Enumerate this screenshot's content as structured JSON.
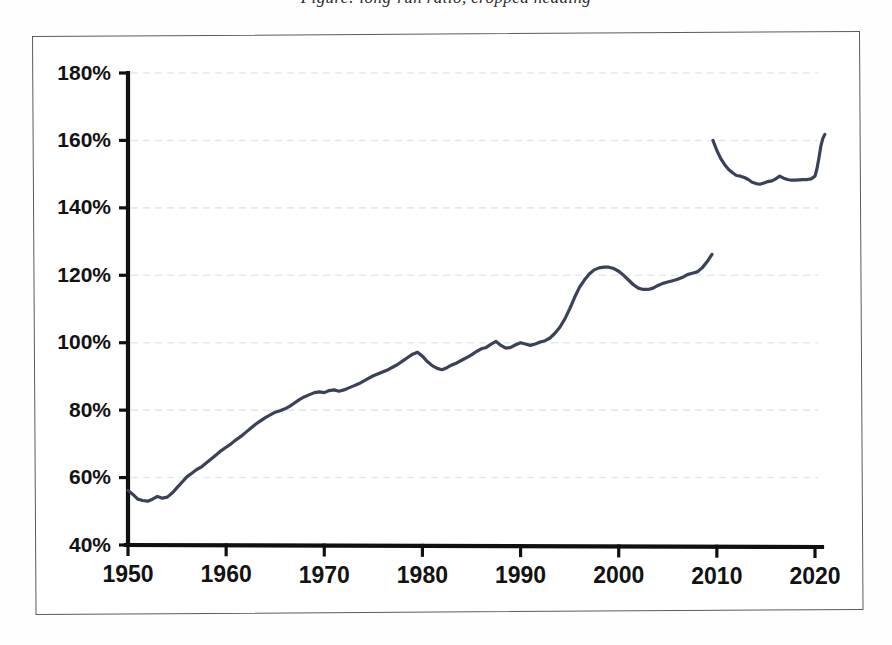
{
  "caption": {
    "clipped_text": "Figure: long-run ratio, cropped heading"
  },
  "figure": {
    "frame_visible": true
  },
  "chart_data": {
    "type": "line",
    "title": "",
    "subtitle": "",
    "xlabel": "",
    "ylabel": "",
    "xlim": [
      1950,
      2021
    ],
    "ylim": [
      40,
      180
    ],
    "grid": true,
    "legend": false,
    "legend_position": "none",
    "y_tick_labels": [
      "40%",
      "60%",
      "80%",
      "100%",
      "120%",
      "140%",
      "160%",
      "180%"
    ],
    "y_tick_values": [
      40,
      60,
      80,
      100,
      120,
      140,
      160,
      180
    ],
    "x_tick_labels": [
      "1950",
      "1960",
      "1970",
      "1980",
      "1990",
      "2000",
      "2010",
      "2020"
    ],
    "x_tick_values": [
      1950,
      1960,
      1970,
      1980,
      1990,
      2000,
      2010,
      2020
    ],
    "series": [
      {
        "name": "ratio",
        "color": "#3a4158",
        "x": [
          1950,
          1950.5,
          1951,
          1951.5,
          1952,
          1952.5,
          1953,
          1953.5,
          1954,
          1954.5,
          1955,
          1955.5,
          1956,
          1956.5,
          1957,
          1957.5,
          1958,
          1958.5,
          1959,
          1959.5,
          1960,
          1960.5,
          1961,
          1961.5,
          1962,
          1962.5,
          1963,
          1963.5,
          1964,
          1964.5,
          1965,
          1965.5,
          1966,
          1966.5,
          1967,
          1967.5,
          1968,
          1968.5,
          1969,
          1969.5,
          1970,
          1970.5,
          1971,
          1971.5,
          1972,
          1972.5,
          1973,
          1973.5,
          1974,
          1974.5,
          1975,
          1975.5,
          1976,
          1976.5,
          1977,
          1977.5,
          1978,
          1978.5,
          1979,
          1979.5,
          1980,
          1980.5,
          1981,
          1981.5,
          1982,
          1982.5,
          1983,
          1983.5,
          1984,
          1984.5,
          1985,
          1985.5,
          1986,
          1986.5,
          1987,
          1987.5,
          1988,
          1988.5,
          1989,
          1989.5,
          1990,
          1990.5,
          1991,
          1991.5,
          1992,
          1992.5,
          1993,
          1993.5,
          1994,
          1994.5,
          1995,
          1995.5,
          1996,
          1996.5,
          1997,
          1997.5,
          1998,
          1998.5,
          1999,
          1999.5,
          2000,
          2000.5,
          2001,
          2001.5,
          2002,
          2002.5,
          2003,
          2003.5,
          2004,
          2004.5,
          2005,
          2005.5,
          2006,
          2006.5,
          2007,
          2007.5,
          2008,
          2008.5,
          2009,
          2009.5,
          2010,
          2010.5,
          2011,
          2011.5,
          2012,
          2012.5,
          2013,
          2013.5,
          2014,
          2014.5,
          2015,
          2015.5,
          2016,
          2016.5,
          2017,
          2017.5,
          2018,
          2018.5,
          2019,
          2019.5,
          2020,
          2020.3,
          2020.6,
          2021
        ],
        "y": [
          56.2,
          55.0,
          53.6,
          53.2,
          53.0,
          53.6,
          54.4,
          53.9,
          54.2,
          55.4,
          57.0,
          58.6,
          60.2,
          61.3,
          62.4,
          63.2,
          64.4,
          65.6,
          66.8,
          68.0,
          69.0,
          70.0,
          71.2,
          72.2,
          73.4,
          74.6,
          75.8,
          76.8,
          77.8,
          78.6,
          79.4,
          79.8,
          80.4,
          81.2,
          82.2,
          83.2,
          84.0,
          84.6,
          85.2,
          85.4,
          85.2,
          85.8,
          86.0,
          85.6,
          86.0,
          86.6,
          87.2,
          87.8,
          88.6,
          89.4,
          90.2,
          90.8,
          91.4,
          92.0,
          92.8,
          93.6,
          94.6,
          95.6,
          96.6,
          97.2,
          96.0,
          94.4,
          93.2,
          92.4,
          92.0,
          92.6,
          93.4,
          94.0,
          94.8,
          95.6,
          96.4,
          97.4,
          98.2,
          98.6,
          99.6,
          100.4,
          99.2,
          98.4,
          98.6,
          99.4,
          100.0,
          99.6,
          99.2,
          99.6,
          100.2,
          100.6,
          101.4,
          102.8,
          104.6,
          107.0,
          110.0,
          113.4,
          116.4,
          118.6,
          120.4,
          121.6,
          122.2,
          122.4,
          122.4,
          122.0,
          121.2,
          120.0,
          118.6,
          117.2,
          116.2,
          115.8,
          115.8,
          116.2,
          117.0,
          117.6,
          118.0,
          118.4,
          118.8,
          119.4,
          120.2,
          120.6,
          121.0,
          122.2,
          124.0,
          126.2,
          128.4,
          130.4,
          132.4,
          133.8,
          134.8,
          136.6,
          139.2,
          142.0,
          145.0,
          148.0,
          151.2,
          154.6,
          158.0,
          161.2,
          163.8,
          165.8,
          166.8,
          166.4,
          167.2,
          165.8,
          166.6,
          165.0,
          162.0,
          160.0
        ]
      }
    ],
    "series_tail": {
      "name": "ratio-tail",
      "x": [
        2009.6,
        2010,
        2010.4,
        2010.8,
        2011.2,
        2011.6,
        2012,
        2012.4,
        2012.8,
        2013.2,
        2013.6,
        2014,
        2014.4,
        2014.8,
        2015.2,
        2015.6,
        2016,
        2016.4,
        2016.8,
        2017.2,
        2017.6,
        2018,
        2018.4,
        2018.8,
        2019.2,
        2019.6,
        2020,
        2020.2,
        2020.4,
        2020.6,
        2020.8,
        2021
      ],
      "y": [
        160.0,
        157.0,
        154.6,
        152.8,
        151.4,
        150.4,
        149.6,
        149.4,
        149.0,
        148.4,
        147.6,
        147.2,
        147.0,
        147.4,
        147.8,
        148.0,
        148.6,
        149.4,
        148.8,
        148.4,
        148.2,
        148.2,
        148.3,
        148.4,
        148.4,
        148.6,
        149.4,
        151.6,
        154.8,
        158.4,
        160.6,
        161.8
      ]
    },
    "annotations": [
      {
        "label": "start",
        "x": 1950,
        "y": 56.2
      },
      {
        "label": "early-trough",
        "x": 1952,
        "y": 53.0
      },
      {
        "label": "1974-peak",
        "x": 1979.5,
        "y": 97.2
      },
      {
        "label": "1990-plateau",
        "x": 1990,
        "y": 122.4
      },
      {
        "label": "1993-trough",
        "x": 2002.5,
        "y": 115.8
      },
      {
        "label": "2008-peak",
        "x": 2019.2,
        "y": 167.2
      },
      {
        "label": "2010s-trough",
        "x": 2014,
        "y": 147.0
      },
      {
        "label": "end",
        "x": 2021,
        "y": 161.8
      }
    ]
  }
}
